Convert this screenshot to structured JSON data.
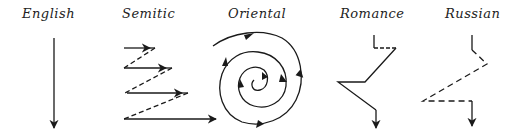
{
  "diagrams": [
    {
      "id": "english",
      "label": "English",
      "pattern": "straight vertical line downward"
    },
    {
      "id": "semitic",
      "label": "Semitic",
      "pattern": "parallel zigzag: solid rightward arrows joined by dashed diagonals"
    },
    {
      "id": "oriental",
      "label": "Oriental",
      "pattern": "inward spiral with arrows"
    },
    {
      "id": "romance",
      "label": "Romance",
      "pattern": "digressive zigzag with solid lines"
    },
    {
      "id": "russian",
      "label": "Russian",
      "pattern": "digressive zigzag with dashed lines"
    }
  ],
  "colors": {
    "ink": "#1a1a1a",
    "background": "#ffffff"
  }
}
